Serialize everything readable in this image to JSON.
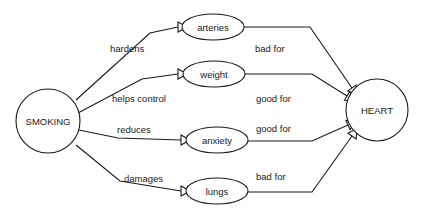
{
  "diagram": {
    "background_color": "#ffffff",
    "stroke_color": "#1a1a1a",
    "nodes": [
      {
        "id": "smoking",
        "label": "SMOKING",
        "shape": "circle",
        "cx": 48,
        "cy": 121,
        "rx": 32,
        "ry": 32
      },
      {
        "id": "arteries",
        "label": "arteries",
        "shape": "ellipse",
        "cx": 213,
        "cy": 27,
        "rx": 31,
        "ry": 13
      },
      {
        "id": "weight",
        "label": "weight",
        "shape": "ellipse",
        "cx": 214,
        "cy": 74,
        "rx": 31,
        "ry": 13
      },
      {
        "id": "anxiety",
        "label": "anxiety",
        "shape": "ellipse",
        "cx": 217,
        "cy": 140,
        "rx": 31,
        "ry": 13
      },
      {
        "id": "lungs",
        "label": "lungs",
        "shape": "ellipse",
        "cx": 217,
        "cy": 191,
        "rx": 31,
        "ry": 13
      },
      {
        "id": "heart",
        "label": "HEART",
        "shape": "circle",
        "cx": 377,
        "cy": 110,
        "rx": 31,
        "ry": 31
      }
    ],
    "edges": [
      {
        "id": "smoking-arteries",
        "from": "smoking",
        "to": "arteries",
        "label": "hardens",
        "label_x": 110,
        "label_y": 48,
        "points": "76,100 150,33 178,27",
        "arrow_x": 178,
        "arrow_y": 27,
        "arrow_dir": 0
      },
      {
        "id": "arteries-heart",
        "from": "arteries",
        "to": "heart",
        "label": "bad for",
        "label_x": 255,
        "label_y": 48,
        "points": "244,27 310,27 352,88",
        "arrow_x": 352,
        "arrow_y": 88,
        "arrow_dir": 55
      },
      {
        "id": "smoking-weight",
        "from": "smoking",
        "to": "weight",
        "label": "helps control",
        "label_x": 112,
        "label_y": 98,
        "points": "78,113 142,79 178,74",
        "arrow_x": 178,
        "arrow_y": 74,
        "arrow_dir": 0
      },
      {
        "id": "weight-heart",
        "from": "weight",
        "to": "heart",
        "label": "good for",
        "label_x": 256,
        "label_y": 98,
        "points": "245,74 312,74 347,96",
        "arrow_x": 347,
        "arrow_y": 96,
        "arrow_dir": 31
      },
      {
        "id": "smoking-anxiety",
        "from": "smoking",
        "to": "anxiety",
        "label": "reduces",
        "label_x": 117,
        "label_y": 129,
        "points": "79,130 118,138 181,140",
        "arrow_x": 181,
        "arrow_y": 140,
        "arrow_dir": 0
      },
      {
        "id": "anxiety-heart",
        "from": "anxiety",
        "to": "heart",
        "label": "good for",
        "label_x": 256,
        "label_y": 128,
        "points": "248,141 312,141 348,125",
        "arrow_x": 348,
        "arrow_y": 125,
        "arrow_dir": -24
      },
      {
        "id": "smoking-lungs",
        "from": "smoking",
        "to": "lungs",
        "label": "damages",
        "label_x": 124,
        "label_y": 178,
        "points": "76,145 120,181 181,191",
        "arrow_x": 181,
        "arrow_y": 191,
        "arrow_dir": 0
      },
      {
        "id": "lungs-heart",
        "from": "lungs",
        "to": "heart",
        "label": "bad for",
        "label_x": 256,
        "label_y": 176,
        "points": "248,192 312,192 352,136",
        "arrow_x": 352,
        "arrow_y": 136,
        "arrow_dir": -54
      }
    ]
  }
}
